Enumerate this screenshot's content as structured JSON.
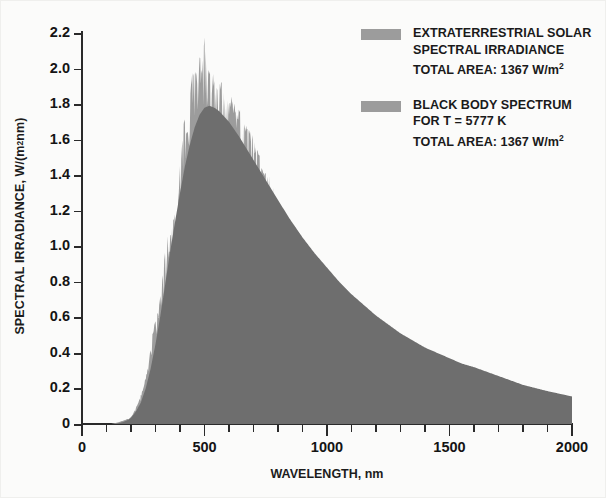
{
  "chart_data": {
    "type": "area",
    "title": "",
    "xlabel": "WAVELENGTH, nm",
    "ylabel": "SPECTRAL IRRADIANCE, W/(m² nm)",
    "xlim": [
      0,
      2000
    ],
    "ylim": [
      0,
      2.2
    ],
    "grid": false,
    "legend_position": "top-right",
    "x_ticks_major": [
      "0",
      "500",
      "1000",
      "1500",
      "2000"
    ],
    "x_tick_major_values": [
      0,
      500,
      1000,
      1500,
      2000
    ],
    "x_tick_minor_step": 100,
    "y_ticks": [
      "0",
      "0.2",
      "0.4",
      "0.6",
      "0.8",
      "1.0",
      "1.2",
      "1.4",
      "1.6",
      "1.8",
      "2.0",
      "2.2"
    ],
    "y_tick_values": [
      0,
      0.2,
      0.4,
      0.6,
      0.8,
      1.0,
      1.2,
      1.4,
      1.6,
      1.8,
      2.0,
      2.2
    ],
    "colors": {
      "solar_fill": "#9c9c9c",
      "blackbody_fill": "#6e6e6e",
      "axis": "#2a2a2a",
      "text": "#141414",
      "background": "#fbfbfa"
    },
    "series": [
      {
        "name": "EXTRATERRESTRIAL SOLAR SPECTRAL IRRADIANCE",
        "fill": "#9c9c9c",
        "total_area_w_m2": 1367,
        "x": [
          120,
          150,
          170,
          190,
          200,
          210,
          220,
          230,
          240,
          250,
          260,
          270,
          280,
          290,
          300,
          310,
          320,
          330,
          340,
          350,
          360,
          370,
          380,
          390,
          400,
          410,
          420,
          430,
          440,
          450,
          460,
          470,
          480,
          490,
          500,
          510,
          520,
          530,
          540,
          550,
          560,
          570,
          580,
          590,
          600,
          620,
          640,
          660,
          680,
          700,
          720,
          740,
          760,
          780,
          800,
          850,
          900,
          950,
          1000,
          1050,
          1100,
          1150,
          1200,
          1250,
          1300,
          1350,
          1400,
          1450,
          1500,
          1550,
          1600,
          1700,
          1800,
          1900,
          2000
        ],
        "y": [
          0.0,
          0.01,
          0.02,
          0.03,
          0.04,
          0.06,
          0.09,
          0.12,
          0.16,
          0.2,
          0.26,
          0.33,
          0.42,
          0.52,
          0.58,
          0.63,
          0.72,
          0.86,
          1.02,
          1.08,
          1.06,
          1.12,
          1.2,
          1.18,
          1.42,
          1.62,
          1.7,
          1.62,
          1.78,
          2.0,
          1.96,
          1.93,
          2.05,
          1.97,
          2.18,
          1.99,
          1.97,
          1.93,
          1.95,
          1.9,
          1.88,
          1.9,
          1.87,
          1.83,
          1.82,
          1.79,
          1.75,
          1.7,
          1.63,
          1.58,
          1.5,
          1.43,
          1.38,
          1.3,
          1.22,
          1.1,
          0.98,
          0.87,
          0.78,
          0.7,
          0.62,
          0.58,
          0.54,
          0.48,
          0.43,
          0.39,
          0.3,
          0.27,
          0.25,
          0.24,
          0.22,
          0.19,
          0.155,
          0.13,
          0.105
        ],
        "noise": "spiky Fraunhofer absorption structure"
      },
      {
        "name": "BLACK BODY SPECTRUM FOR T = 5777 K",
        "fill": "#6e6e6e",
        "temperature_k": 5777,
        "total_area_w_m2": 1367,
        "x": [
          120,
          150,
          170,
          190,
          200,
          220,
          240,
          260,
          280,
          300,
          320,
          340,
          360,
          380,
          400,
          420,
          440,
          460,
          480,
          500,
          520,
          540,
          560,
          580,
          600,
          640,
          680,
          720,
          760,
          800,
          850,
          900,
          950,
          1000,
          1050,
          1100,
          1150,
          1200,
          1250,
          1300,
          1350,
          1400,
          1450,
          1500,
          1550,
          1600,
          1700,
          1800,
          1900,
          2000
        ],
        "y": [
          0.0,
          0.005,
          0.012,
          0.025,
          0.035,
          0.07,
          0.12,
          0.2,
          0.31,
          0.45,
          0.61,
          0.79,
          0.97,
          1.14,
          1.3,
          1.45,
          1.57,
          1.67,
          1.74,
          1.78,
          1.79,
          1.78,
          1.76,
          1.73,
          1.7,
          1.62,
          1.53,
          1.44,
          1.35,
          1.26,
          1.15,
          1.05,
          0.96,
          0.88,
          0.8,
          0.73,
          0.67,
          0.61,
          0.56,
          0.51,
          0.47,
          0.43,
          0.4,
          0.37,
          0.34,
          0.32,
          0.27,
          0.22,
          0.185,
          0.155
        ]
      }
    ]
  },
  "legend": {
    "entries": [
      {
        "swatch_color": "#9c9c9c",
        "line1": "EXTRATERRESTRIAL SOLAR",
        "line2": "SPECTRAL IRRADIANCE",
        "line3_prefix": "TOTAL AREA: 1367 W/m",
        "line3_sup": "2"
      },
      {
        "swatch_color": "#9c9c9c",
        "line1": "BLACK BODY SPECTRUM",
        "line2": "FOR T = 5777 K",
        "line3_prefix": "TOTAL AREA: 1367 W/m",
        "line3_sup": "2"
      }
    ]
  },
  "axes": {
    "x_title": "WAVELENGTH, nm",
    "y_title_prefix": "SPECTRAL IRRADIANCE, W/(m",
    "y_title_sup": "2",
    "y_title_suffix": " nm)"
  }
}
